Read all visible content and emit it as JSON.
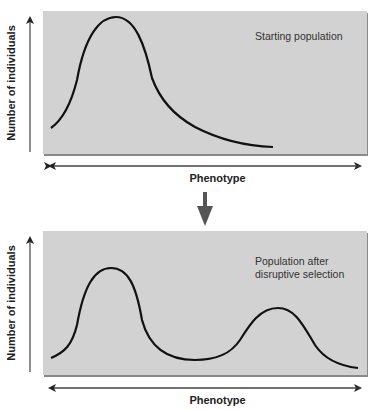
{
  "top_chart": {
    "annotation": "Starting population",
    "xlabel": "Phenotype",
    "ylabel": "Number of individuals",
    "curve": "unimodal, skewed right, peak near left"
  },
  "bottom_chart": {
    "annotation_line1": "Population after",
    "annotation_line2": "disruptive selection",
    "xlabel": "Phenotype",
    "ylabel": "Number of individuals",
    "curve": "bimodal, tall left peak, shorter right peak, trough in middle"
  },
  "transition_arrow": "down-arrow",
  "colors": {
    "panel_bg": "#d2d2d2",
    "curve": "#111111",
    "arrow": "#444444"
  }
}
